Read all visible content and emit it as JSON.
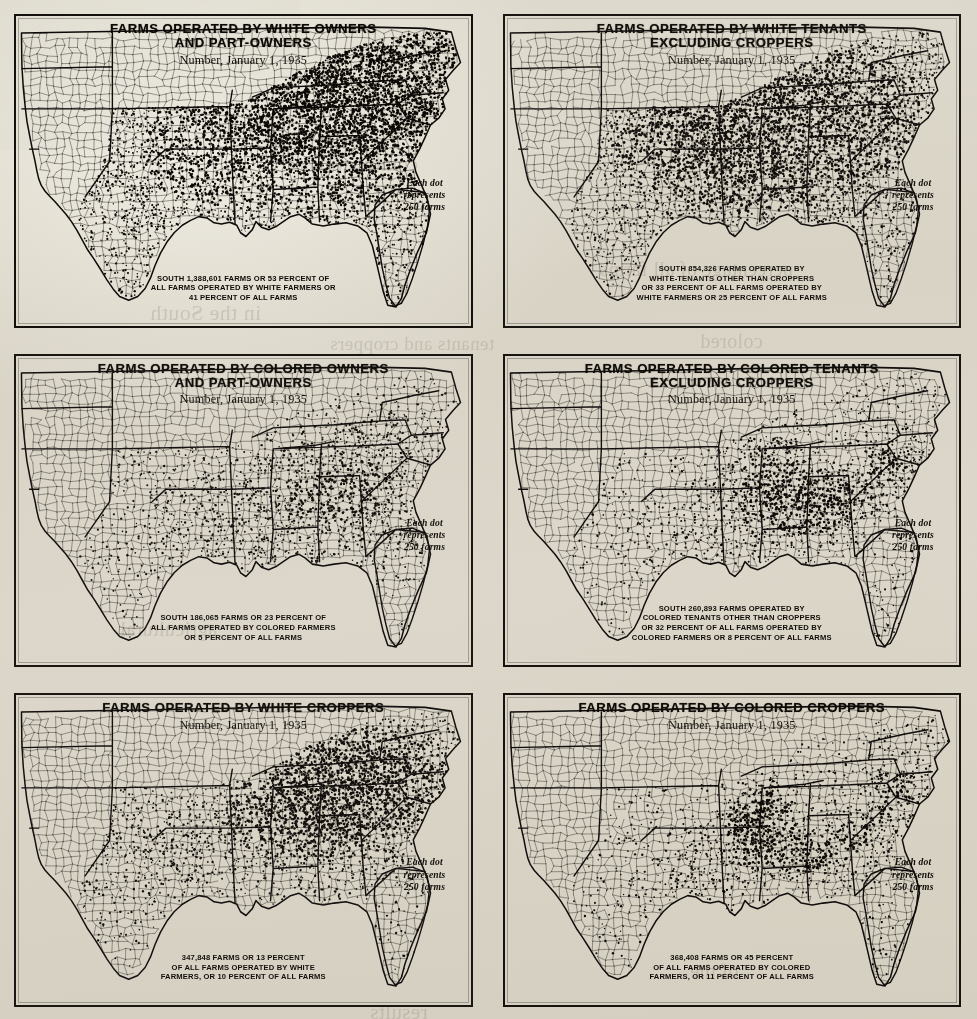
{
  "document": {
    "kind": "dot-density-map-plate-sheet",
    "sheet_background": "#d8d3c5",
    "ink_color": "#1a1713",
    "legend_text": "Each dot\nrepresents\n250 farms",
    "subtitle": "Number, January 1, 1935",
    "dot_value_farms": 250
  },
  "bleed_through": [
    {
      "text": "combinations",
      "x": 300,
      "y": 152,
      "size": 21
    },
    {
      "text": "percentage of all farms",
      "x": 600,
      "y": 258,
      "size": 20
    },
    {
      "text": "in the South",
      "x": 150,
      "y": 300,
      "size": 22
    },
    {
      "text": "colored",
      "x": 700,
      "y": 330,
      "size": 20
    },
    {
      "text": "tenants and croppers",
      "x": 330,
      "y": 333,
      "size": 19
    },
    {
      "text": "agricultural",
      "x": 120,
      "y": 618,
      "size": 20
    },
    {
      "text": "of the",
      "x": 690,
      "y": 960,
      "size": 20
    },
    {
      "text": "results",
      "x": 370,
      "y": 1000,
      "size": 21
    }
  ],
  "maps": [
    {
      "id": "white-owners-and-part-owners",
      "title": "FARMS OPERATED BY WHITE OWNERS\nAND PART-OWNERS",
      "subtitle": "Number, January 1, 1935",
      "legend": "Each dot\nrepresents\n250 farms",
      "caption": "SOUTH 1,388,601 FARMS OR 53 PERCENT OF\nALL FARMS OPERATED BY WHITE FARMERS OR\n41 PERCENT OF ALL FARMS",
      "stats": {
        "farms": 1388601,
        "percent_of_farms_operated_by_race_group": 53,
        "percent_of_all_farms": 41,
        "race_group": "white",
        "tenure": "owners and part-owners"
      },
      "density_field": {
        "base": 0.52,
        "peak_intensity": 1.0,
        "hotspots": [
          {
            "x": 0.6,
            "y": 0.16,
            "r": 0.2,
            "w": 1.0
          },
          {
            "x": 0.7,
            "y": 0.24,
            "r": 0.19,
            "w": 0.95
          },
          {
            "x": 0.79,
            "y": 0.2,
            "r": 0.16,
            "w": 0.88
          },
          {
            "x": 0.66,
            "y": 0.33,
            "r": 0.16,
            "w": 0.72
          },
          {
            "x": 0.84,
            "y": 0.33,
            "r": 0.13,
            "w": 0.62
          },
          {
            "x": 0.52,
            "y": 0.42,
            "r": 0.16,
            "w": 0.42
          },
          {
            "x": 0.35,
            "y": 0.5,
            "r": 0.18,
            "w": 0.35
          },
          {
            "x": 0.72,
            "y": 0.55,
            "r": 0.16,
            "w": 0.4
          }
        ]
      }
    },
    {
      "id": "white-tenants-excluding-croppers",
      "title": "FARMS OPERATED BY WHITE TENANTS\nEXCLUDING CROPPERS",
      "subtitle": "Number, January 1, 1935",
      "legend": "Each dot\nrepresents\n250 farms",
      "caption": "SOUTH 854,326 FARMS OPERATED BY\nWHITE-TENANTS OTHER THAN CROPPERS\nOR 33 PERCENT OF ALL FARMS OPERATED BY\nWHITE FARMERS OR 25 PERCENT OF ALL FARMS",
      "stats": {
        "farms": 854326,
        "percent_of_farms_operated_by_race_group": 33,
        "percent_of_all_farms": 25,
        "race_group": "white",
        "tenure": "tenants excluding croppers"
      },
      "density_field": {
        "base": 0.42,
        "peak_intensity": 0.8,
        "hotspots": [
          {
            "x": 0.38,
            "y": 0.4,
            "r": 0.17,
            "w": 0.72
          },
          {
            "x": 0.47,
            "y": 0.33,
            "r": 0.15,
            "w": 0.66
          },
          {
            "x": 0.58,
            "y": 0.3,
            "r": 0.15,
            "w": 0.6
          },
          {
            "x": 0.69,
            "y": 0.27,
            "r": 0.15,
            "w": 0.58
          },
          {
            "x": 0.8,
            "y": 0.25,
            "r": 0.14,
            "w": 0.55
          },
          {
            "x": 0.63,
            "y": 0.5,
            "r": 0.15,
            "w": 0.5
          },
          {
            "x": 0.5,
            "y": 0.52,
            "r": 0.14,
            "w": 0.45
          },
          {
            "x": 0.82,
            "y": 0.42,
            "r": 0.13,
            "w": 0.42
          }
        ]
      }
    },
    {
      "id": "colored-owners-and-part-owners",
      "title": "FARMS OPERATED BY COLORED OWNERS\nAND PART-OWNERS",
      "subtitle": "Number, January 1, 1935",
      "legend": "Each dot\nrepresents\n250 farms",
      "caption": "SOUTH 186,065 FARMS OR 23 PERCENT OF\nALL FARMS OPERATED BY COLORED FARMERS\nOR 5 PERCENT OF ALL FARMS",
      "stats": {
        "farms": 186065,
        "percent_of_farms_operated_by_race_group": 23,
        "percent_of_all_farms": 5,
        "race_group": "colored",
        "tenure": "owners and part-owners"
      },
      "density_field": {
        "base": 0.14,
        "peak_intensity": 0.42,
        "hotspots": [
          {
            "x": 0.66,
            "y": 0.42,
            "r": 0.15,
            "w": 0.38
          },
          {
            "x": 0.76,
            "y": 0.4,
            "r": 0.15,
            "w": 0.36
          },
          {
            "x": 0.85,
            "y": 0.32,
            "r": 0.12,
            "w": 0.32
          },
          {
            "x": 0.58,
            "y": 0.55,
            "r": 0.14,
            "w": 0.3
          },
          {
            "x": 0.45,
            "y": 0.58,
            "r": 0.14,
            "w": 0.26
          },
          {
            "x": 0.8,
            "y": 0.55,
            "r": 0.13,
            "w": 0.28
          },
          {
            "x": 0.37,
            "y": 0.43,
            "r": 0.12,
            "w": 0.18
          }
        ]
      }
    },
    {
      "id": "colored-tenants-excluding-croppers",
      "title": "FARMS OPERATED BY COLORED TENANTS\nEXCLUDING CROPPERS",
      "subtitle": "Number, January 1, 1935",
      "legend": "Each dot\nrepresents\n250 farms",
      "caption": "SOUTH 260,893 FARMS OPERATED BY\nCOLORED TENANTS OTHER THAN CROPPERS\nOR 32 PERCENT OF ALL FARMS OPERATED BY\nCOLORED FARMERS OR 8 PERCENT OF ALL FARMS",
      "stats": {
        "farms": 260893,
        "percent_of_farms_operated_by_race_group": 32,
        "percent_of_all_farms": 8,
        "race_group": "colored",
        "tenure": "tenants excluding croppers"
      },
      "density_field": {
        "base": 0.15,
        "peak_intensity": 0.72,
        "hotspots": [
          {
            "x": 0.575,
            "y": 0.345,
            "r": 0.085,
            "w": 0.95
          },
          {
            "x": 0.6,
            "y": 0.46,
            "r": 0.085,
            "w": 0.92
          },
          {
            "x": 0.655,
            "y": 0.51,
            "r": 0.08,
            "w": 0.8
          },
          {
            "x": 0.7,
            "y": 0.48,
            "r": 0.075,
            "w": 0.66
          },
          {
            "x": 0.77,
            "y": 0.45,
            "r": 0.085,
            "w": 0.52
          },
          {
            "x": 0.86,
            "y": 0.37,
            "r": 0.09,
            "w": 0.5
          },
          {
            "x": 0.86,
            "y": 0.3,
            "r": 0.075,
            "w": 0.42
          },
          {
            "x": 0.5,
            "y": 0.57,
            "r": 0.1,
            "w": 0.34
          },
          {
            "x": 0.4,
            "y": 0.58,
            "r": 0.11,
            "w": 0.26
          }
        ]
      }
    },
    {
      "id": "white-croppers",
      "title": "FARMS OPERATED BY WHITE CROPPERS",
      "subtitle": "Number, January 1, 1935",
      "legend": "Each dot\nrepresents\n250 farms",
      "caption": "347,848 FARMS OR 13 PERCENT\nOF ALL FARMS OPERATED BY WHITE\nFARMERS, OR 10 PERCENT OF ALL FARMS",
      "stats": {
        "farms": 347848,
        "percent_of_farms_operated_by_race_group": 13,
        "percent_of_all_farms": 10,
        "race_group": "white",
        "tenure": "croppers"
      },
      "density_field": {
        "base": 0.16,
        "peak_intensity": 0.78,
        "hotspots": [
          {
            "x": 0.62,
            "y": 0.26,
            "r": 0.14,
            "w": 0.8
          },
          {
            "x": 0.72,
            "y": 0.22,
            "r": 0.13,
            "w": 0.76
          },
          {
            "x": 0.82,
            "y": 0.24,
            "r": 0.13,
            "w": 0.72
          },
          {
            "x": 0.88,
            "y": 0.3,
            "r": 0.11,
            "w": 0.66
          },
          {
            "x": 0.66,
            "y": 0.42,
            "r": 0.13,
            "w": 0.6
          },
          {
            "x": 0.75,
            "y": 0.45,
            "r": 0.13,
            "w": 0.58
          },
          {
            "x": 0.55,
            "y": 0.4,
            "r": 0.12,
            "w": 0.5
          },
          {
            "x": 0.37,
            "y": 0.52,
            "r": 0.14,
            "w": 0.38
          },
          {
            "x": 0.3,
            "y": 0.44,
            "r": 0.12,
            "w": 0.26
          }
        ]
      }
    },
    {
      "id": "colored-croppers",
      "title": "FARMS OPERATED BY COLORED CROPPERS",
      "subtitle": "Number, January 1, 1935",
      "legend": "Each dot\nrepresents\n250 farms",
      "caption": "368,408 FARMS OR 45 PERCENT\nOF ALL FARMS OPERATED BY COLORED\nFARMERS, OR 11 PERCENT OF ALL FARMS",
      "stats": {
        "farms": 368408,
        "percent_of_farms_operated_by_race_group": 45,
        "percent_of_all_farms": 11,
        "race_group": "colored",
        "tenure": "croppers"
      },
      "density_field": {
        "base": 0.13,
        "peak_intensity": 1.0,
        "hotspots": [
          {
            "x": 0.545,
            "y": 0.4,
            "r": 0.065,
            "w": 1.3
          },
          {
            "x": 0.555,
            "y": 0.48,
            "r": 0.06,
            "w": 1.25
          },
          {
            "x": 0.585,
            "y": 0.33,
            "r": 0.06,
            "w": 1.0
          },
          {
            "x": 0.62,
            "y": 0.52,
            "r": 0.075,
            "w": 0.7
          },
          {
            "x": 0.7,
            "y": 0.5,
            "r": 0.085,
            "w": 0.58
          },
          {
            "x": 0.78,
            "y": 0.47,
            "r": 0.085,
            "w": 0.56
          },
          {
            "x": 0.86,
            "y": 0.36,
            "r": 0.09,
            "w": 0.58
          },
          {
            "x": 0.87,
            "y": 0.27,
            "r": 0.08,
            "w": 0.52
          },
          {
            "x": 0.47,
            "y": 0.56,
            "r": 0.085,
            "w": 0.4
          },
          {
            "x": 0.39,
            "y": 0.59,
            "r": 0.095,
            "w": 0.3
          }
        ]
      }
    }
  ]
}
